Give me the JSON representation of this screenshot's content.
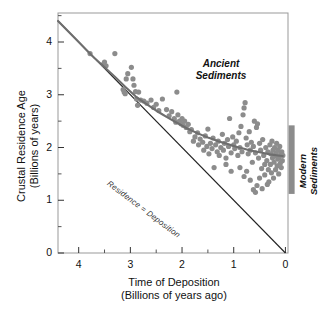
{
  "chart_data": {
    "type": "scatter",
    "title": "",
    "xlabel": "Time of Deposition",
    "xlabel_sub": "(Billions of years ago)",
    "ylabel": "Crustal Residence Age",
    "ylabel_sub": "(Billions of years)",
    "xlim": [
      4.4,
      -0.05
    ],
    "ylim": [
      0,
      4.55
    ],
    "x_reversed": true,
    "grid": false,
    "legend_position": "none",
    "xticks": [
      4,
      3,
      2,
      1,
      0
    ],
    "xtick_labels": [
      "4",
      "3",
      "2",
      "1",
      "0"
    ],
    "xminor_ticks": [
      4.5,
      3.5,
      2.5,
      1.5,
      0.5
    ],
    "yticks": [
      0,
      1,
      2,
      3,
      4
    ],
    "ytick_labels": [
      "0",
      "1",
      "2",
      "3",
      "4"
    ],
    "yminor_ticks": [
      0.5,
      1.5,
      2.5,
      3.5,
      4.5
    ],
    "point_color": "#8c8c8c",
    "curve_color": "#6e6e6e",
    "line_color": "#222222",
    "bar_color": "#8c8c8c",
    "annotations": [
      {
        "name": "ancient-sediments",
        "text_line1": "Ancient",
        "text_line2": "Sediments",
        "x": 2.05,
        "y": 3.45
      },
      {
        "name": "modern-sediments",
        "text_line1": "Modern",
        "text_line2": "Sediments",
        "x": -0.22,
        "y": 1.75
      },
      {
        "name": "residence-equals-deposition",
        "text": "Residence = Deposition",
        "x": 2.55,
        "y": 1.95
      }
    ],
    "reference_line": {
      "name": "Residence = Deposition",
      "label": "Residence = Deposition",
      "x": [
        4.4,
        0
      ],
      "y": [
        4.4,
        0
      ]
    },
    "fit_curve": {
      "name": "Mean crustal residence age trend",
      "x": [
        4.4,
        4.0,
        3.7,
        3.5,
        3.3,
        3.1,
        2.9,
        2.7,
        2.5,
        2.3,
        2.1,
        1.9,
        1.7,
        1.5,
        1.3,
        1.1,
        0.9,
        0.7,
        0.5,
        0.3,
        0.15,
        0.05
      ],
      "y": [
        4.4,
        4.0,
        3.7,
        3.52,
        3.34,
        3.15,
        2.97,
        2.83,
        2.7,
        2.58,
        2.47,
        2.36,
        2.27,
        2.19,
        2.12,
        2.06,
        2.0,
        1.95,
        1.91,
        1.87,
        1.85,
        1.84
      ]
    },
    "modern_bar": {
      "x": -0.12,
      "y_min": 1.12,
      "y_max": 2.42
    },
    "series": [
      {
        "name": "Sediment samples",
        "color": "#8c8c8c",
        "points": [
          [
            3.78,
            3.78
          ],
          [
            3.5,
            3.62
          ],
          [
            3.52,
            3.58
          ],
          [
            3.47,
            3.55
          ],
          [
            3.3,
            3.78
          ],
          [
            3.14,
            3.1
          ],
          [
            3.12,
            3.05
          ],
          [
            3.1,
            3.02
          ],
          [
            3.08,
            3.3
          ],
          [
            3.05,
            3.4
          ],
          [
            2.98,
            3.52
          ],
          [
            2.95,
            3.3
          ],
          [
            2.93,
            3.18
          ],
          [
            2.9,
            3.06
          ],
          [
            2.88,
            2.92
          ],
          [
            2.86,
            2.8
          ],
          [
            2.84,
            3.05
          ],
          [
            2.8,
            2.9
          ],
          [
            2.74,
            2.88
          ],
          [
            2.68,
            2.84
          ],
          [
            2.6,
            2.9
          ],
          [
            2.55,
            2.76
          ],
          [
            2.5,
            2.82
          ],
          [
            2.45,
            2.7
          ],
          [
            2.38,
            2.92
          ],
          [
            2.3,
            2.72
          ],
          [
            2.25,
            2.6
          ],
          [
            2.2,
            2.68
          ],
          [
            2.15,
            2.55
          ],
          [
            2.12,
            2.48
          ],
          [
            2.1,
            3.05
          ],
          [
            2.08,
            2.62
          ],
          [
            2.05,
            2.5
          ],
          [
            2.02,
            2.45
          ],
          [
            2.0,
            2.55
          ],
          [
            1.98,
            2.42
          ],
          [
            1.95,
            2.5
          ],
          [
            1.92,
            2.38
          ],
          [
            1.88,
            2.44
          ],
          [
            1.85,
            2.3
          ],
          [
            1.82,
            2.34
          ],
          [
            1.78,
            2.12
          ],
          [
            1.75,
            2.2
          ],
          [
            1.7,
            2.28
          ],
          [
            1.68,
            2.05
          ],
          [
            1.65,
            2.16
          ],
          [
            1.6,
            2.1
          ],
          [
            1.58,
            1.95
          ],
          [
            1.55,
            2.22
          ],
          [
            1.52,
            2.02
          ],
          [
            1.5,
            2.35
          ],
          [
            1.48,
            1.88
          ],
          [
            1.45,
            2.08
          ],
          [
            1.42,
            1.98
          ],
          [
            1.4,
            2.18
          ],
          [
            1.38,
            1.62
          ],
          [
            1.35,
            2.05
          ],
          [
            1.32,
            1.92
          ],
          [
            1.3,
            2.12
          ],
          [
            1.28,
            1.85
          ],
          [
            1.25,
            2.0
          ],
          [
            1.22,
            2.25
          ],
          [
            1.2,
            1.95
          ],
          [
            1.18,
            2.08
          ],
          [
            1.15,
            1.8
          ],
          [
            1.12,
            2.15
          ],
          [
            1.1,
            2.02
          ],
          [
            1.08,
            2.55
          ],
          [
            1.05,
            1.9
          ],
          [
            1.02,
            2.2
          ],
          [
            1.0,
            2.05
          ],
          [
            0.98,
            1.98
          ],
          [
            0.95,
            2.12
          ],
          [
            0.92,
            1.85
          ],
          [
            0.9,
            2.28
          ],
          [
            0.88,
            2.0
          ],
          [
            0.86,
            2.4
          ],
          [
            0.84,
            1.92
          ],
          [
            0.82,
            2.62
          ],
          [
            0.8,
            2.75
          ],
          [
            0.78,
            2.85
          ],
          [
            0.76,
            2.18
          ],
          [
            0.74,
            2.05
          ],
          [
            0.72,
            1.88
          ],
          [
            0.7,
            2.3
          ],
          [
            0.68,
            1.95
          ],
          [
            0.66,
            2.1
          ],
          [
            0.64,
            1.72
          ],
          [
            0.62,
            2.02
          ],
          [
            0.6,
            2.5
          ],
          [
            0.58,
            1.9
          ],
          [
            0.56,
            2.38
          ],
          [
            0.54,
            2.45
          ],
          [
            0.52,
            1.8
          ],
          [
            0.5,
            2.08
          ],
          [
            0.48,
            1.95
          ],
          [
            0.46,
            1.6
          ],
          [
            0.44,
            2.15
          ],
          [
            0.42,
            1.85
          ],
          [
            0.4,
            1.48
          ],
          [
            0.38,
            2.0
          ],
          [
            0.36,
            1.75
          ],
          [
            0.34,
            1.92
          ],
          [
            0.32,
            1.35
          ],
          [
            0.3,
            2.05
          ],
          [
            0.29,
            1.68
          ],
          [
            0.28,
            1.88
          ],
          [
            0.27,
            1.52
          ],
          [
            0.26,
            2.12
          ],
          [
            0.25,
            1.8
          ],
          [
            0.24,
            1.95
          ],
          [
            0.23,
            1.42
          ],
          [
            0.22,
            1.72
          ],
          [
            0.21,
            2.0
          ],
          [
            0.2,
            1.85
          ],
          [
            0.19,
            1.58
          ],
          [
            0.18,
            1.9
          ],
          [
            0.17,
            2.08
          ],
          [
            0.16,
            1.65
          ],
          [
            0.15,
            1.78
          ],
          [
            0.14,
            1.95
          ],
          [
            0.13,
            1.5
          ],
          [
            0.12,
            1.82
          ],
          [
            0.11,
            2.02
          ],
          [
            0.1,
            1.7
          ],
          [
            0.09,
            1.88
          ],
          [
            0.08,
            1.62
          ],
          [
            0.07,
            1.92
          ],
          [
            0.06,
            1.75
          ],
          [
            0.05,
            1.85
          ],
          [
            0.62,
            1.2
          ],
          [
            0.58,
            1.15
          ],
          [
            0.55,
            1.28
          ],
          [
            0.68,
            1.38
          ],
          [
            0.45,
            1.22
          ],
          [
            0.35,
            1.3
          ],
          [
            0.5,
            1.42
          ],
          [
            0.75,
            1.55
          ],
          [
            0.8,
            1.45
          ],
          [
            0.88,
            1.62
          ],
          [
            1.05,
            1.55
          ],
          [
            1.15,
            1.68
          ],
          [
            0.4,
            1.68
          ],
          [
            0.33,
            1.58
          ]
        ]
      }
    ]
  }
}
